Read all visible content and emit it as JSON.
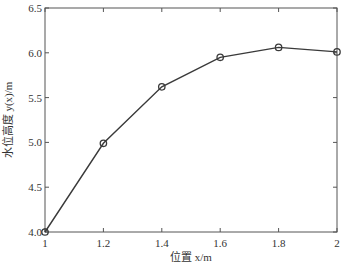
{
  "chart_data": {
    "type": "line",
    "title": "",
    "xlabel": "位置 x/m",
    "ylabel": "水位高度 y(x)/m",
    "x": [
      1.0,
      1.2,
      1.4,
      1.6,
      1.8,
      2.0
    ],
    "series": [
      {
        "name": "水位高度",
        "values": [
          4.0,
          4.99,
          5.62,
          5.95,
          6.06,
          6.01
        ],
        "marker": "circle",
        "color": "#3a3a3a"
      }
    ],
    "xlim": [
      1,
      2
    ],
    "ylim": [
      4.0,
      6.5
    ],
    "xticks": [
      "1",
      "1.2",
      "1.4",
      "1.6",
      "1.8",
      "2"
    ],
    "yticks": [
      "4.0",
      "4.5",
      "5.0",
      "5.5",
      "6.0",
      "6.5"
    ],
    "grid": false,
    "legend": null
  }
}
